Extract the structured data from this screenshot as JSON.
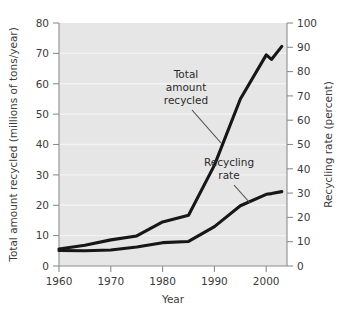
{
  "chart_data": {
    "type": "line",
    "title": "",
    "xlabel": "Year",
    "ylabel": "Total amount recycled (millions of tons/year)",
    "y2label": "Recycling rate (percent)",
    "xlim": [
      1960,
      2004
    ],
    "ylim": [
      0,
      80
    ],
    "y2lim": [
      0,
      100
    ],
    "xticks": [
      1960,
      1970,
      1980,
      1990,
      2000
    ],
    "xticklabels": [
      "1960",
      "1970",
      "1980",
      "1990",
      "2000"
    ],
    "yticks": [
      0,
      10,
      20,
      30,
      40,
      50,
      60,
      70,
      80
    ],
    "yticklabels": [
      "0",
      "10",
      "20",
      "30",
      "40",
      "50",
      "60",
      "70",
      "80"
    ],
    "y2ticks": [
      0,
      10,
      20,
      30,
      40,
      50,
      60,
      70,
      80,
      90,
      100
    ],
    "y2ticklabels": [
      "0",
      "10",
      "20",
      "30",
      "40",
      "50",
      "60",
      "70",
      "80",
      "90",
      "100"
    ],
    "grid": true,
    "grid_axis": "y",
    "legend": "annotations",
    "series": [
      {
        "name": "Total amount recycled",
        "axis": "left",
        "units": "millions of tons/year",
        "x": [
          1960,
          1965,
          1970,
          1975,
          1980,
          1985,
          1990,
          1995,
          2000,
          2001,
          2003
        ],
        "values": [
          5.6,
          6.8,
          8.6,
          9.9,
          14.5,
          16.7,
          33.2,
          55.0,
          69.5,
          68.0,
          72.3
        ]
      },
      {
        "name": "Recycling rate",
        "axis": "right",
        "units": "percent",
        "x": [
          1960,
          1965,
          1970,
          1975,
          1980,
          1985,
          1990,
          1995,
          2000,
          2001,
          2003
        ],
        "values": [
          6.4,
          6.3,
          6.6,
          7.8,
          9.6,
          10.1,
          16.2,
          24.8,
          29.5,
          29.8,
          30.6
        ]
      }
    ],
    "annotations": [
      {
        "text_lines": [
          "Total",
          "amount",
          "recycled"
        ],
        "label": "Total amount recycled",
        "points_to_series": "Total amount recycled"
      },
      {
        "text_lines": [
          "Recycling",
          "rate"
        ],
        "label": "Recycling rate",
        "points_to_series": "Recycling rate"
      }
    ],
    "colors": {
      "line": "#171717",
      "plot_background": "#e6e6e6",
      "gridline": "#f3f3f3",
      "axis": "#8d8d8d",
      "text": "#3b3b3b",
      "page_background": "#ffffff"
    }
  }
}
